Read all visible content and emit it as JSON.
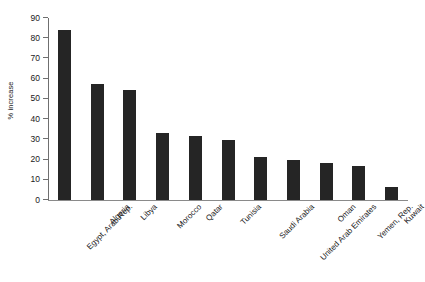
{
  "chart_data": {
    "type": "bar",
    "title": "",
    "xlabel": "",
    "ylabel": "% increase",
    "ylim": [
      0,
      90
    ],
    "ytick_step": 10,
    "yticks": [
      0,
      10,
      20,
      30,
      40,
      50,
      60,
      70,
      80,
      90
    ],
    "grid": false,
    "legend": false,
    "bar_color": "#252525",
    "axis_color": "#6f6f6f",
    "categories": [
      "Egypt, Arab Rep.",
      "Algeria",
      "Libya",
      "Morocco",
      "Qatar",
      "Tunisia",
      "Saudi Arabia",
      "United Arab Emirates",
      "Oman",
      "Yemen, Rep.",
      "Kuwait"
    ],
    "values": [
      84,
      57.5,
      54.5,
      33,
      31.5,
      29.5,
      21.5,
      20,
      18.5,
      17,
      6.5
    ]
  }
}
